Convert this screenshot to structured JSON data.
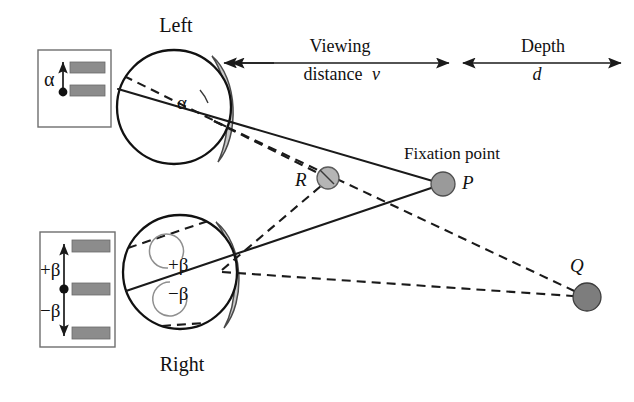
{
  "figure": {
    "type": "optical-geometry-diagram",
    "background_color": "#ffffff",
    "ink_color": "#111111"
  },
  "labels": {
    "left_eye": "Left",
    "right_eye": "Right",
    "viewing_distance_line1": "Viewing",
    "viewing_distance_line2": "distance",
    "viewing_distance_symbol": "v",
    "depth_line1": "Depth",
    "depth_symbol": "d",
    "fixation_point": "Fixation point",
    "point_p": "P",
    "point_q": "Q",
    "point_r": "R",
    "alpha": "α",
    "beta_plus": "+β",
    "beta_minus": "−β"
  },
  "insets": {
    "top": {
      "name": "left-eye-retinal-image-inset",
      "angle_label": "α",
      "bars": 2,
      "bar_color": "#8c8c8c",
      "has_up_arrow": true,
      "fixation_dot_color": "#111111"
    },
    "bottom": {
      "name": "right-eye-retinal-image-inset",
      "angle_label_top": "+β",
      "angle_label_bottom": "−β",
      "bars": 3,
      "bar_color": "#8c8c8c",
      "has_double_arrow": true,
      "fixation_dot_color": "#111111"
    }
  },
  "nodes": {
    "P": {
      "label": "P",
      "x": 443,
      "y": 184,
      "r": 12,
      "color": "#9a9a9a",
      "note": "Fixation point"
    },
    "Q": {
      "label": "Q",
      "x": 587,
      "y": 297,
      "r": 14,
      "color": "#7d7d7d"
    },
    "R": {
      "label": "R",
      "x": 328,
      "y": 178,
      "r": 11,
      "color": "#b5b5b5"
    }
  },
  "eyes": {
    "left": {
      "cx": 174,
      "cy": 107,
      "r": 58,
      "label": "Left"
    },
    "right": {
      "cx": 180,
      "cy": 272,
      "r": 58,
      "label": "Right"
    }
  },
  "measures": {
    "viewing_distance": {
      "x_start": 230,
      "x_end": 450,
      "y": 63
    },
    "depth": {
      "x_start": 462,
      "x_end": 622,
      "y": 63
    }
  }
}
